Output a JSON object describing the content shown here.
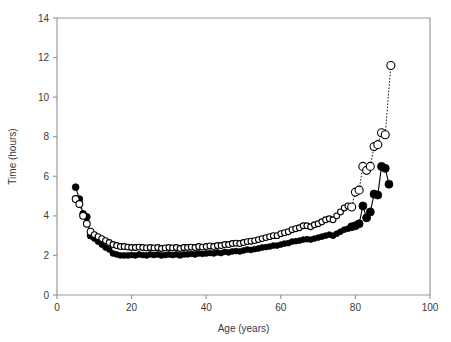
{
  "chart_data": {
    "type": "scatter",
    "title": "",
    "xlabel": "Age (years)",
    "ylabel": "Time (hours)",
    "xlim": [
      0,
      100
    ],
    "ylim": [
      0,
      14
    ],
    "xticks": [
      0,
      20,
      40,
      60,
      80,
      100
    ],
    "yticks": [
      0,
      2,
      4,
      6,
      8,
      10,
      12,
      14
    ],
    "grid": false,
    "legend": "none",
    "frame_color": "#9a9a9a",
    "marker_color": "#000000",
    "series": [
      {
        "name": "filled-circles",
        "marker": "filled circle",
        "line": "solid",
        "x": [
          5,
          6,
          7,
          8,
          9,
          10,
          11,
          12,
          13,
          14,
          15,
          16,
          17,
          18,
          19,
          20,
          21,
          22,
          23,
          24,
          25,
          26,
          27,
          28,
          29,
          30,
          31,
          32,
          33,
          34,
          35,
          36,
          37,
          38,
          39,
          40,
          41,
          42,
          43,
          44,
          45,
          46,
          47,
          48,
          49,
          50,
          51,
          52,
          53,
          54,
          55,
          56,
          57,
          58,
          59,
          60,
          61,
          62,
          63,
          64,
          65,
          66,
          67,
          68,
          69,
          70,
          71,
          72,
          73,
          74,
          75,
          76,
          77,
          78,
          79,
          80,
          81,
          82,
          83,
          84,
          85,
          86,
          87,
          88,
          89
        ],
        "y": [
          5.45,
          4.85,
          4.1,
          3.95,
          3.0,
          2.85,
          2.7,
          2.55,
          2.4,
          2.3,
          2.1,
          2.05,
          2.0,
          2.0,
          2.0,
          2.02,
          2.0,
          2.05,
          2.02,
          2.0,
          2.05,
          2.02,
          2.05,
          2.0,
          2.02,
          2.05,
          2.02,
          2.05,
          2.0,
          2.05,
          2.05,
          2.08,
          2.05,
          2.1,
          2.08,
          2.1,
          2.12,
          2.1,
          2.15,
          2.12,
          2.18,
          2.15,
          2.2,
          2.22,
          2.2,
          2.25,
          2.3,
          2.28,
          2.32,
          2.35,
          2.4,
          2.42,
          2.45,
          2.5,
          2.5,
          2.55,
          2.6,
          2.62,
          2.7,
          2.72,
          2.75,
          2.8,
          2.82,
          2.8,
          2.85,
          2.9,
          2.95,
          3.0,
          3.05,
          3.0,
          3.1,
          3.2,
          3.3,
          3.35,
          3.45,
          3.5,
          3.6,
          4.5,
          3.9,
          4.2,
          5.1,
          5.05,
          6.5,
          6.4,
          5.6
        ]
      },
      {
        "name": "open-circles",
        "marker": "open circle",
        "line": "dotted",
        "x": [
          5,
          6,
          7,
          8,
          9,
          10,
          11,
          12,
          13,
          14,
          15,
          16,
          17,
          18,
          19,
          20,
          21,
          22,
          23,
          24,
          25,
          26,
          27,
          28,
          29,
          30,
          31,
          32,
          33,
          34,
          35,
          36,
          37,
          38,
          39,
          40,
          41,
          42,
          43,
          44,
          45,
          46,
          47,
          48,
          49,
          50,
          51,
          52,
          53,
          54,
          55,
          56,
          57,
          58,
          59,
          60,
          61,
          62,
          63,
          64,
          65,
          66,
          67,
          68,
          69,
          70,
          71,
          72,
          73,
          74,
          75,
          76,
          77,
          78,
          79,
          80,
          81,
          82,
          83,
          84,
          85,
          86,
          87,
          88,
          89.5
        ],
        "y": [
          4.85,
          4.6,
          4.0,
          3.6,
          3.2,
          3.05,
          2.95,
          2.85,
          2.75,
          2.65,
          2.55,
          2.5,
          2.45,
          2.45,
          2.42,
          2.4,
          2.4,
          2.42,
          2.4,
          2.38,
          2.4,
          2.38,
          2.4,
          2.35,
          2.38,
          2.4,
          2.38,
          2.4,
          2.35,
          2.4,
          2.4,
          2.42,
          2.4,
          2.45,
          2.42,
          2.45,
          2.48,
          2.45,
          2.5,
          2.5,
          2.55,
          2.55,
          2.6,
          2.62,
          2.6,
          2.65,
          2.7,
          2.72,
          2.75,
          2.8,
          2.85,
          2.9,
          2.95,
          3.0,
          3.0,
          3.1,
          3.15,
          3.2,
          3.3,
          3.35,
          3.4,
          3.5,
          3.5,
          3.45,
          3.55,
          3.6,
          3.7,
          3.8,
          3.85,
          3.8,
          4.0,
          4.2,
          4.4,
          4.5,
          4.45,
          5.2,
          5.3,
          6.5,
          6.3,
          6.5,
          7.5,
          7.6,
          8.2,
          8.1,
          11.6
        ]
      }
    ]
  }
}
